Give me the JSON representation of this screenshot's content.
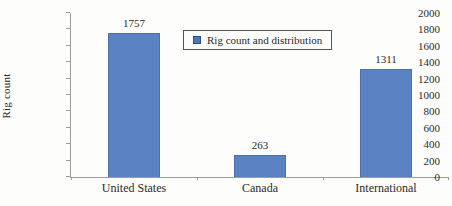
{
  "chart_data": {
    "type": "bar",
    "title": "",
    "categories": [
      "United States",
      "Canada",
      "International"
    ],
    "values": [
      1757,
      263,
      1311
    ],
    "series": [
      {
        "name": "Rig count and distribution",
        "values": [
          1757,
          263,
          1311
        ]
      }
    ],
    "data_labels": [
      "1757",
      "263",
      "1311"
    ],
    "xlabel": "",
    "ylabel": "Rig count",
    "ylim": [
      0,
      2000
    ],
    "ytick_step": 200,
    "ytick_labels": [
      "0",
      "200",
      "400",
      "600",
      "800",
      "1000",
      "1200",
      "1400",
      "1600",
      "1800",
      "2000"
    ],
    "grid": false,
    "legend": {
      "label": "Rig count and distribution",
      "position": "top-center",
      "marker": "square-icon"
    },
    "colors": {
      "bar_fill": "#5b82c3",
      "bar_border": "#4c71ab",
      "legend_marker": "#4e77bb",
      "axis": "#9c9c98",
      "text": "#2d2a25",
      "background": "#fdfdfc"
    }
  }
}
